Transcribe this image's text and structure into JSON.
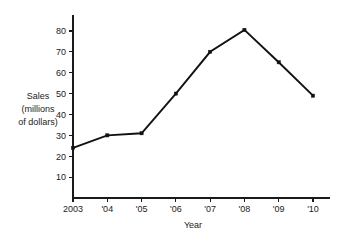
{
  "chart_data": {
    "type": "line",
    "title": "",
    "xlabel": "Year",
    "ylabel": "Sales (millions of dollars)",
    "ylabel_lines": [
      "Sales",
      "(millions",
      "of dollars)"
    ],
    "categories": [
      "2003",
      "'04",
      "'05",
      "'06",
      "'07",
      "'08",
      "'09",
      "'10"
    ],
    "values": [
      24,
      30,
      31,
      50,
      70,
      80.5,
      65,
      49
    ],
    "series": [
      {
        "name": "Sales",
        "values": [
          24,
          30,
          31,
          50,
          70,
          80.5,
          65,
          49
        ]
      }
    ],
    "yticks": [
      10,
      20,
      30,
      40,
      50,
      60,
      70,
      80
    ],
    "ytick_labels": [
      "10",
      "20",
      "30",
      "40",
      "50",
      "60",
      "70",
      "80"
    ],
    "ylim": [
      0,
      85
    ],
    "xlim": [
      0,
      7
    ],
    "grid": false,
    "legend": false,
    "legend_position": "none",
    "marker": "square",
    "line_color": "#111111",
    "axis_color": "#1a1a1a",
    "background_color": "#ffffff"
  }
}
